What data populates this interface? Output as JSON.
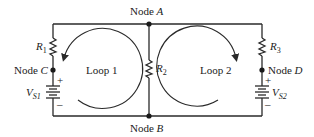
{
  "nodes": {
    "A": {
      "prefix": "Node ",
      "name": "A"
    },
    "B": {
      "prefix": "Node ",
      "name": "B"
    },
    "C": {
      "prefix": "Node ",
      "name": "C"
    },
    "D": {
      "prefix": "Node ",
      "name": "D"
    }
  },
  "resistors": {
    "R1": {
      "letter": "R",
      "sub": "1"
    },
    "R2": {
      "letter": "R",
      "sub": "2"
    },
    "R3": {
      "letter": "R",
      "sub": "3"
    }
  },
  "sources": {
    "VS1": {
      "letter": "V",
      "sub": "S1",
      "plus": "+",
      "minus": "–"
    },
    "VS2": {
      "letter": "V",
      "sub": "S2",
      "plus": "+",
      "minus": "–"
    }
  },
  "loops": {
    "loop1": {
      "label": "Loop 1",
      "direction": "counterclockwise"
    },
    "loop2": {
      "label": "Loop 2",
      "direction": "clockwise"
    }
  }
}
